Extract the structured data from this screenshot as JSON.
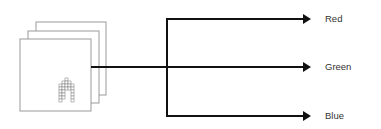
{
  "diagram": {
    "title": "",
    "source": {
      "kind": "stacked-image-layers",
      "layer_count": 3,
      "glyph": "pixel-arch-icon"
    },
    "outputs": [
      {
        "label": "Red"
      },
      {
        "label": "Green"
      },
      {
        "label": "Blue"
      }
    ],
    "colors": {
      "line": "#111111",
      "sheet_border": "#9a9a9a",
      "pixel_border": "#8c8c8c",
      "text": "#333333",
      "background": "#ffffff"
    }
  }
}
